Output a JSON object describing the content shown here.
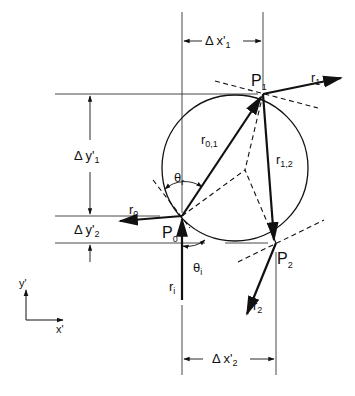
{
  "diagram": {
    "points": {
      "P0": {
        "label": "P",
        "sub": "0",
        "x": 182,
        "y": 216
      },
      "P1": {
        "label": "P",
        "sub": "1",
        "x": 263,
        "y": 94
      },
      "P2": {
        "label": "P",
        "sub": "2",
        "x": 276,
        "y": 243
      }
    },
    "circle": {
      "cx": 235,
      "cy": 168,
      "r": 73
    },
    "rays": {
      "r_i": {
        "label": "r",
        "sub": "i"
      },
      "r_0": {
        "label": "r",
        "sub": "0"
      },
      "r_1": {
        "label": "r",
        "sub": "1"
      },
      "r_2": {
        "label": "r",
        "sub": "2"
      },
      "r_01": {
        "label": "r",
        "sub": "0,1"
      },
      "r_12": {
        "label": "r",
        "sub": "1,2"
      }
    },
    "angles": {
      "theta_r": {
        "label": "θ",
        "sub": "r"
      },
      "theta_i": {
        "label": "θ",
        "sub": "i"
      }
    },
    "dimensions": {
      "dx1": {
        "label": "Δ x'",
        "sub": "1"
      },
      "dx2": {
        "label": "Δ x'",
        "sub": "2"
      },
      "dy1": {
        "label": "Δ y'",
        "sub": "1"
      },
      "dy2": {
        "label": "Δ y'",
        "sub": "2"
      }
    },
    "axes": {
      "x": "x'",
      "y": "y'"
    }
  }
}
